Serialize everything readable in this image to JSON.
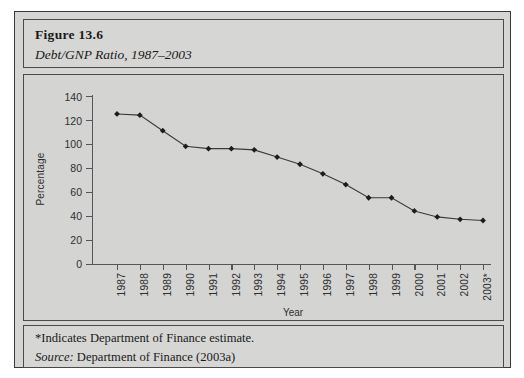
{
  "figure": {
    "number": "Figure 13.6",
    "subtitle": "Debt/GNP Ratio, 1987–2003"
  },
  "footnote": {
    "estimate_note": "*Indicates Department of Finance estimate.",
    "source_label": "Source:",
    "source_text": " Department of Finance (2003a)"
  },
  "chart_data": {
    "type": "line",
    "title": "Debt/GNP Ratio, 1987–2003",
    "xlabel": "Year",
    "ylabel": "Percentage",
    "categories": [
      "1987",
      "1988",
      "1989",
      "1990",
      "1991",
      "1992",
      "1993",
      "1994",
      "1995",
      "1996",
      "1997",
      "1998",
      "1999",
      "2000",
      "2001",
      "2002",
      "2003*"
    ],
    "values": [
      125,
      124,
      111,
      98,
      96,
      96,
      95,
      89,
      83,
      75,
      66,
      55,
      55,
      44,
      39,
      37,
      36
    ],
    "ylim": [
      0,
      140
    ],
    "ytick_labels": [
      "0",
      "20",
      "40",
      "60",
      "80",
      "100",
      "120",
      "140"
    ],
    "ytick_values": [
      0,
      20,
      40,
      60,
      80,
      100,
      120,
      140
    ],
    "grid": false,
    "legend": "none",
    "marker": "diamond",
    "line_color": "#3a3a3a",
    "marker_color": "#1c1c1c",
    "background_color": "#d4d4d2",
    "annotations": [
      "*Indicates Department of Finance estimate."
    ]
  }
}
